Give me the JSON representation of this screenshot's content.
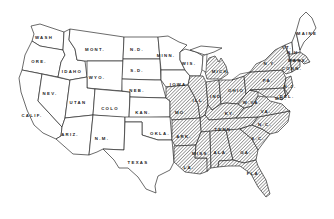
{
  "map": {
    "title": "",
    "hatch_color": "#3a3a3a",
    "line_color": "#2b2b2b",
    "background": "#ffffff",
    "states": [
      {
        "id": "wash",
        "label": "WASH",
        "hatched": false,
        "x": 44,
        "y": 37
      },
      {
        "id": "ore",
        "label": "ORE.",
        "hatched": false,
        "x": 39,
        "y": 61
      },
      {
        "id": "calif",
        "label": "CALIF.",
        "hatched": false,
        "x": 32,
        "y": 115
      },
      {
        "id": "nev",
        "label": "NEV.",
        "hatched": false,
        "x": 50,
        "y": 93
      },
      {
        "id": "idaho",
        "label": "IDAHO",
        "hatched": false,
        "x": 72,
        "y": 71
      },
      {
        "id": "mont",
        "label": "MONT.",
        "hatched": false,
        "x": 95,
        "y": 49
      },
      {
        "id": "wyo",
        "label": "WYO.",
        "hatched": false,
        "x": 97,
        "y": 77
      },
      {
        "id": "utan",
        "label": "UTAN",
        "hatched": false,
        "x": 78,
        "y": 102
      },
      {
        "id": "colo",
        "label": "COLO",
        "hatched": false,
        "x": 110,
        "y": 108
      },
      {
        "id": "ariz",
        "label": "ARIZ.",
        "hatched": false,
        "x": 70,
        "y": 134
      },
      {
        "id": "nm",
        "label": "N.M.",
        "hatched": false,
        "x": 102,
        "y": 138
      },
      {
        "id": "nd",
        "label": "N.D.",
        "hatched": false,
        "x": 137,
        "y": 49
      },
      {
        "id": "sd",
        "label": "S.D.",
        "hatched": false,
        "x": 137,
        "y": 70
      },
      {
        "id": "neb",
        "label": "NEB.",
        "hatched": false,
        "x": 137,
        "y": 90
      },
      {
        "id": "kan",
        "label": "KAN.",
        "hatched": false,
        "x": 143,
        "y": 112
      },
      {
        "id": "okla",
        "label": "OKLA.",
        "hatched": false,
        "x": 160,
        "y": 133
      },
      {
        "id": "texas",
        "label": "TEXAS",
        "hatched": false,
        "x": 138,
        "y": 162
      },
      {
        "id": "minn",
        "label": "MINN.",
        "hatched": false,
        "x": 166,
        "y": 55
      },
      {
        "id": "iowa",
        "label": "IOWA",
        "hatched": false,
        "x": 178,
        "y": 84
      },
      {
        "id": "wis",
        "label": "WIS.",
        "hatched": false,
        "x": 189,
        "y": 63
      },
      {
        "id": "mich",
        "label": "MICH.",
        "hatched": true,
        "x": 221,
        "y": 71
      },
      {
        "id": "mo",
        "label": "MO.",
        "hatched": true,
        "x": 181,
        "y": 112
      },
      {
        "id": "ill",
        "label": "ILL.",
        "hatched": true,
        "x": 199,
        "y": 100
      },
      {
        "id": "ind",
        "label": "IND.",
        "hatched": true,
        "x": 217,
        "y": 96
      },
      {
        "id": "ohio",
        "label": "OHIO",
        "hatched": true,
        "x": 236,
        "y": 90
      },
      {
        "id": "ky",
        "label": "KY.",
        "hatched": true,
        "x": 230,
        "y": 113
      },
      {
        "id": "tenn",
        "label": "TENN.",
        "hatched": true,
        "x": 224,
        "y": 129
      },
      {
        "id": "ark",
        "label": "ARK.",
        "hatched": true,
        "x": 184,
        "y": 136
      },
      {
        "id": "la",
        "label": "LA.",
        "hatched": true,
        "x": 189,
        "y": 167
      },
      {
        "id": "miss",
        "label": "MISS.",
        "hatched": true,
        "x": 201,
        "y": 153
      },
      {
        "id": "ala",
        "label": "ALA.",
        "hatched": true,
        "x": 221,
        "y": 152
      },
      {
        "id": "ga",
        "label": "GA.",
        "hatched": true,
        "x": 246,
        "y": 152
      },
      {
        "id": "fla",
        "label": "FLA.",
        "hatched": true,
        "x": 254,
        "y": 173
      },
      {
        "id": "sc",
        "label": "S.C.",
        "hatched": true,
        "x": 258,
        "y": 138
      },
      {
        "id": "nc",
        "label": "N.C.",
        "hatched": true,
        "x": 265,
        "y": 124
      },
      {
        "id": "va",
        "label": "VA.",
        "hatched": true,
        "x": 266,
        "y": 111
      },
      {
        "id": "wva",
        "label": "W.VA.",
        "hatched": true,
        "x": 252,
        "y": 102
      },
      {
        "id": "pa",
        "label": "PA.",
        "hatched": true,
        "x": 268,
        "y": 80
      },
      {
        "id": "ny",
        "label": "N.Y.",
        "hatched": true,
        "x": 270,
        "y": 63
      },
      {
        "id": "maine",
        "label": "MAINE",
        "hatched": false,
        "x": 307,
        "y": 33
      },
      {
        "id": "vt",
        "label": "VT.",
        "hatched": false,
        "x": 287,
        "y": 47
      },
      {
        "id": "nh",
        "label": "N.H.",
        "hatched": false,
        "x": 294,
        "y": 52
      },
      {
        "id": "md",
        "label": "MD.",
        "hatched": true,
        "x": 281,
        "y": 98
      },
      {
        "id": "nj",
        "label": "N.J.",
        "hatched": true,
        "x": 290,
        "y": 86
      },
      {
        "id": "mass",
        "label": "MASS.",
        "hatched": true,
        "x": 298,
        "y": 60
      },
      {
        "id": "conn",
        "label": "CONN.",
        "hatched": true,
        "x": 292,
        "y": 68
      },
      {
        "id": "del",
        "label": "DEL.",
        "hatched": true,
        "x": 287,
        "y": 96
      }
    ]
  }
}
